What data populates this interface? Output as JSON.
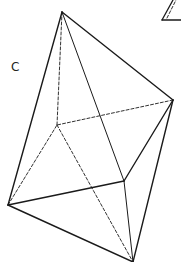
{
  "figure": {
    "label": "C",
    "stroke_color": "#1a1a1a",
    "vertices": {
      "top": [
        62,
        12
      ],
      "right": [
        173,
        100
      ],
      "back": [
        57,
        125
      ],
      "front": [
        124,
        181
      ],
      "left": [
        8,
        205
      ],
      "bottom": [
        133,
        262
      ]
    },
    "solid_edges": [
      [
        "top",
        "right"
      ],
      [
        "top",
        "left"
      ],
      [
        "top",
        "front"
      ],
      [
        "right",
        "front"
      ],
      [
        "right",
        "bottom"
      ],
      [
        "left",
        "front"
      ],
      [
        "left",
        "bottom"
      ],
      [
        "front",
        "bottom"
      ]
    ],
    "dashed_edges": [
      [
        "top",
        "back"
      ],
      [
        "right",
        "back"
      ],
      [
        "left",
        "back"
      ],
      [
        "back",
        "bottom"
      ]
    ],
    "neighbor_fragment": {
      "solid": [
        [
          [
            162,
            20
          ],
          [
            181,
            20
          ]
        ],
        [
          [
            162,
            20
          ],
          [
            173,
            0
          ]
        ]
      ],
      "dashed": [
        [
          [
            167,
            18
          ],
          [
            176,
            0
          ]
        ]
      ]
    }
  }
}
